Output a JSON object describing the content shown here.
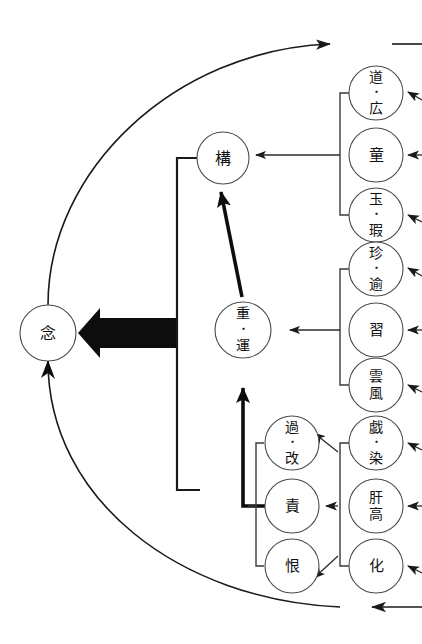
{
  "diagram": {
    "type": "node-link-diagram",
    "canvas": {
      "width": 422,
      "height": 644
    },
    "colors": {
      "background": "#ffffff",
      "node_stroke": "#4a4a4a",
      "node_fill": "#ffffff",
      "line": "#1a1a1a",
      "bold_arrow": "#0d0d0d",
      "text": "#111111"
    },
    "nodes": {
      "root": {
        "label": "念",
        "cx": 48,
        "cy": 333,
        "r": 28
      },
      "kou": {
        "label": "構",
        "cx": 223,
        "cy": 158,
        "r": 26
      },
      "juun_line1": {
        "label": "重",
        "line2": "・",
        "line3": "運",
        "cx": 243,
        "cy": 330,
        "r": 28
      },
      "mid_group": [
        {
          "label_l1": "過",
          "label_l2": "・",
          "label_l3": "改",
          "cx": 292,
          "cy": 443,
          "r": 27
        },
        {
          "label_l1": "責",
          "cx": 292,
          "cy": 506,
          "r": 27
        },
        {
          "label_l1": "恨",
          "cx": 292,
          "cy": 566,
          "r": 27
        }
      ],
      "right_group_1": [
        {
          "label_l1": "道",
          "label_l2": "・",
          "label_l3": "広",
          "cx": 376,
          "cy": 93,
          "r": 27
        },
        {
          "label_l1": "童",
          "cx": 376,
          "cy": 155,
          "r": 27
        },
        {
          "label_l1": "玉",
          "label_l2": "・",
          "label_l3": "瑕",
          "cx": 376,
          "cy": 215,
          "r": 27
        }
      ],
      "right_group_2": [
        {
          "label_l1": "珍",
          "label_l2": "・",
          "label_l3": "逾",
          "cx": 376,
          "cy": 269,
          "r": 27
        },
        {
          "label_l1": "習",
          "cx": 376,
          "cy": 330,
          "r": 27
        },
        {
          "label_l1": "雲",
          "label_l2": "風",
          "cx": 376,
          "cy": 385,
          "r": 27
        }
      ],
      "right_group_3": [
        {
          "label_l1": "戯",
          "label_l2": "・",
          "label_l3": "染",
          "cx": 376,
          "cy": 443,
          "r": 27
        },
        {
          "label_l1": "肝",
          "label_l2": "高",
          "cx": 376,
          "cy": 506,
          "r": 27
        },
        {
          "label_l1": "化",
          "cx": 376,
          "cy": 566,
          "r": 27
        }
      ]
    },
    "edges": {
      "bold_arrow_to_root": "thick black arrow pointing left into 念",
      "kou_from_right": "arrow from right bracket group 1 into 構",
      "juun_from_right": "arrow from right bracket group 2 into 重・運",
      "juun_from_kou": "bold arrow from 重・運 up into 構",
      "mid_from_right": "three arrows from right bracket group 3 into 過・改 / 責 / 恨",
      "outer_arc_top": "arc from 念 sweeping up-right, arrowhead pointing right",
      "outer_arc_bottom": "arc from bottom-right back up-left into 念, arrowhead pointing left at right end"
    },
    "external_arrows": {
      "count": 9,
      "description": "short arrows entering each right-column node from off-canvas right"
    }
  }
}
